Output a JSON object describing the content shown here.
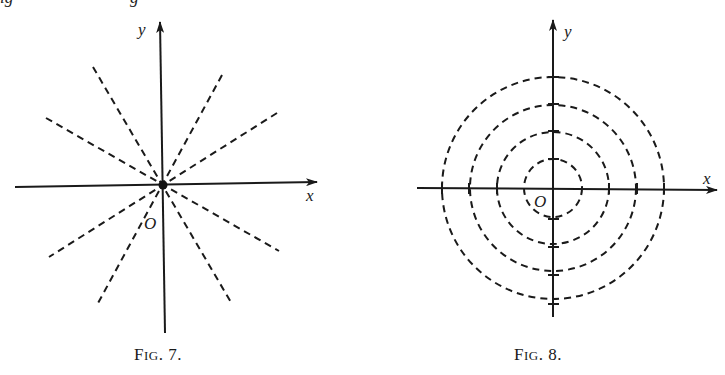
{
  "top_clipped_text": {
    "left": "ig",
    "middle": "g"
  },
  "figures": [
    {
      "id": "fig7",
      "caption_prefix": "F",
      "caption_smallcaps": "IG",
      "caption_number": ". 7.",
      "axis_x_label": "x",
      "axis_y_label": "y",
      "origin_label": "O",
      "description": "Family of dashed straight lines through the origin (a node), with a heavy dot at the origin",
      "colors": {
        "ink": "#1a1a1a"
      }
    },
    {
      "id": "fig8",
      "caption_prefix": "F",
      "caption_smallcaps": "IG",
      "caption_number": ". 8.",
      "axis_x_label": "x",
      "axis_y_label": "y",
      "origin_label": "O",
      "description": "Four concentric dashed circles centered at the origin, with tick marks where they cross the axes",
      "circle_count": 4,
      "colors": {
        "ink": "#1a1a1a"
      }
    }
  ]
}
